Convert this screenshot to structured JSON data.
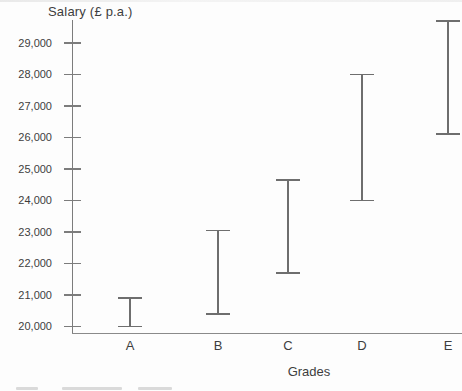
{
  "colors": {
    "background": "#fdfdfd",
    "axis": "#7c7c7c",
    "bar": "#6e6e6e",
    "text": "#3d3d3d"
  },
  "chart_data": {
    "type": "range-bar",
    "title": "Salary (£ p.a.)",
    "xlabel": "Grades",
    "ylabel": "Salary (£ p.a.)",
    "categories": [
      "A",
      "B",
      "C",
      "D",
      "E"
    ],
    "series": [
      {
        "name": "Salary range per grade",
        "ranges": [
          {
            "grade": "A",
            "min": 20000,
            "max": 20900
          },
          {
            "grade": "B",
            "min": 20400,
            "max": 23050
          },
          {
            "grade": "C",
            "min": 21700,
            "max": 24650
          },
          {
            "grade": "D",
            "min": 24000,
            "max": 28000
          },
          {
            "grade": "E",
            "min": 26100,
            "max": 29700
          }
        ]
      }
    ],
    "y_axis": {
      "tick_values": [
        20000,
        21000,
        22000,
        23000,
        24000,
        25000,
        26000,
        27000,
        28000,
        29000
      ],
      "tick_labels": [
        "20,000",
        "21,000",
        "22,000",
        "23,000",
        "24,000",
        "25,000",
        "26,000",
        "27,000",
        "28,000",
        "29,000"
      ],
      "ylim": [
        19800,
        29800
      ]
    },
    "legend": "none",
    "grid": "off"
  }
}
